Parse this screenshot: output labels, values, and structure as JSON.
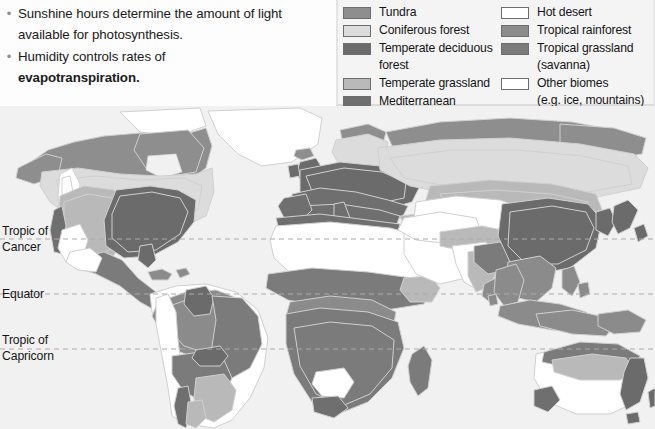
{
  "slide": {
    "bullets": [
      {
        "line1": "Sunshine hours determine the amount of light",
        "line2": "available for photosynthesis.",
        "bold": ""
      },
      {
        "line1": "Humidity controls rates of",
        "line2": "evapotranspiration.",
        "bold": "evapotranspiration"
      }
    ]
  },
  "legend": {
    "left": [
      {
        "label": "Tundra",
        "color": "#8e8e8e"
      },
      {
        "label": "Coniferous forest",
        "color": "#dcdcdc"
      },
      {
        "label": "Temperate deciduous\nforest",
        "color": "#6b6b6b"
      },
      {
        "label": "Temperate grassland",
        "color": "#b9b9b9"
      },
      {
        "label": "Mediterranean",
        "color": "#6f6f6f"
      }
    ],
    "right": [
      {
        "label": "Hot desert",
        "color": "#ffffff"
      },
      {
        "label": "Tropical rainforest",
        "color": "#8b8b8b"
      },
      {
        "label": "Tropical grassland\n(savanna)",
        "color": "#7b7b7b"
      },
      {
        "label": "Other biomes\n(e.g. ice, mountains)",
        "color": "#ffffff"
      }
    ]
  },
  "map": {
    "latitude_labels": {
      "cancer": "Tropic of\nCancer",
      "equator": "Equator",
      "capricorn": "Tropic of\nCapricorn"
    },
    "ocean_color": "#f1f1f1",
    "line_color": "#b0a9a9",
    "latitudes": {
      "cancer_y": 133,
      "equator_y": 188,
      "capricorn_y": 243
    }
  },
  "biome_colors": {
    "tundra": "#8e8e8e",
    "coniferous": "#dcdcdc",
    "deciduous": "#6b6b6b",
    "temperate_grassland": "#b9b9b9",
    "mediterranean": "#6f6f6f",
    "hot_desert": "#ffffff",
    "rainforest": "#8b8b8b",
    "savanna": "#7b7b7b",
    "other": "#ffffff",
    "outline": "#d2d2d2"
  }
}
